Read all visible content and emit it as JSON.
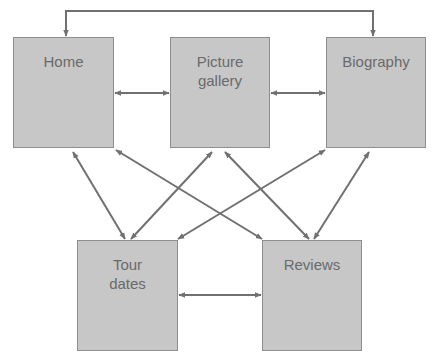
{
  "diagram": {
    "type": "site-navigation-map",
    "colors": {
      "node_fill": "#c7c7c7",
      "node_border": "#8e8e8e",
      "node_text": "#6a6a6a",
      "arrow": "#707070",
      "background": "#ffffff"
    },
    "nodes": [
      {
        "id": "home",
        "label": "Home",
        "x": 13,
        "y": 37,
        "w": 101,
        "h": 111
      },
      {
        "id": "gallery",
        "label": "Picture\ngallery",
        "x": 170,
        "y": 37,
        "w": 100,
        "h": 111
      },
      {
        "id": "biography",
        "label": "Biography",
        "x": 326,
        "y": 37,
        "w": 100,
        "h": 111
      },
      {
        "id": "tour",
        "label": "Tour\ndates",
        "x": 77,
        "y": 240,
        "w": 101,
        "h": 111
      },
      {
        "id": "reviews",
        "label": "Reviews",
        "x": 262,
        "y": 240,
        "w": 100,
        "h": 111
      }
    ],
    "edges": [
      {
        "from": "home",
        "to": "biography",
        "bidirectional": true,
        "route": "over-top"
      },
      {
        "from": "home",
        "to": "gallery",
        "bidirectional": true
      },
      {
        "from": "gallery",
        "to": "biography",
        "bidirectional": true
      },
      {
        "from": "tour",
        "to": "reviews",
        "bidirectional": true
      },
      {
        "from": "home",
        "to": "tour",
        "bidirectional": true
      },
      {
        "from": "home",
        "to": "reviews",
        "bidirectional": true
      },
      {
        "from": "gallery",
        "to": "tour",
        "bidirectional": true
      },
      {
        "from": "gallery",
        "to": "reviews",
        "bidirectional": true
      },
      {
        "from": "biography",
        "to": "tour",
        "bidirectional": true
      },
      {
        "from": "biography",
        "to": "reviews",
        "bidirectional": true
      }
    ]
  }
}
